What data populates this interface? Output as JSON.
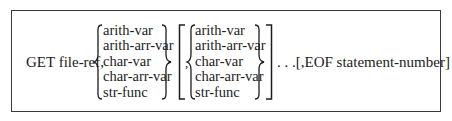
{
  "statement": {
    "keyword": "GET",
    "first_arg": "file-ref,",
    "group1": {
      "options": [
        "arith-var",
        "arith-arr-var",
        "char-var",
        "char-arr-var",
        "str-func"
      ]
    },
    "group2": {
      "prefix": ",",
      "options": [
        "arith-var",
        "arith-arr-var",
        "char-var",
        "char-arr-var",
        "str-func"
      ]
    },
    "repeat_marker": ". . .",
    "optional_clause": "[,EOF statement-number]"
  }
}
